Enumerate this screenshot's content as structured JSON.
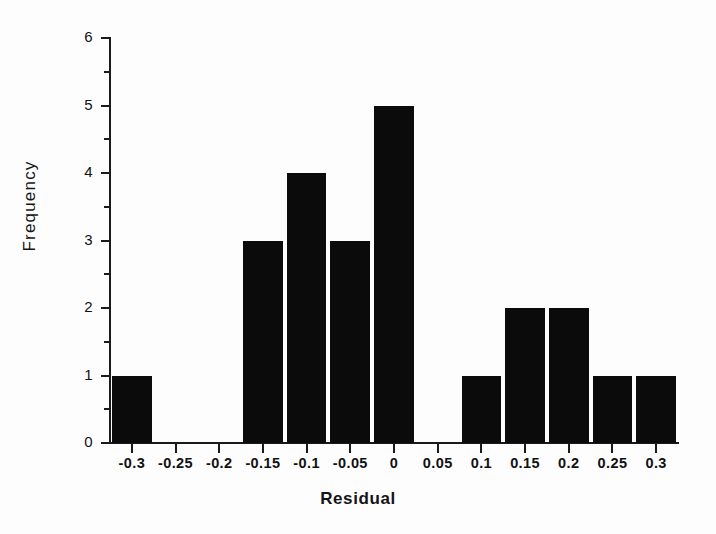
{
  "chart_data": {
    "type": "bar",
    "title": "",
    "xlabel": "Residual",
    "ylabel": "Frequency",
    "categories": [
      "-0.3",
      "-0.25",
      "-0.2",
      "-0.15",
      "-0.1",
      "-0.05",
      "0",
      "0.05",
      "0.1",
      "0.15",
      "0.2",
      "0.25",
      "0.3"
    ],
    "x": [
      -0.3,
      -0.25,
      -0.2,
      -0.15,
      -0.1,
      -0.05,
      0,
      0.05,
      0.1,
      0.15,
      0.2,
      0.25,
      0.3
    ],
    "values": [
      1,
      0,
      0,
      3,
      4,
      3,
      5,
      0,
      1,
      2,
      2,
      1,
      1
    ],
    "xlim": [
      -0.325,
      0.325
    ],
    "ylim": [
      0,
      6
    ],
    "y_major_ticks": [
      0,
      1,
      2,
      3,
      4,
      5,
      6
    ],
    "y_tick_labels": [
      "0",
      "1",
      "2",
      "3",
      "4",
      "5",
      "6"
    ],
    "y_minor_ticks": [
      0.5,
      1.5,
      2.5,
      3.5,
      4.5,
      5.5
    ],
    "x_tick_labels": [
      "-0.3",
      "-0.25",
      "-0.2",
      "-0.15",
      "-0.1",
      "-0.05",
      "0",
      "0.05",
      "0.1",
      "0.15",
      "0.2",
      "0.25",
      "0.3"
    ],
    "grid": false,
    "legend": false,
    "bar_color": "#0b0b0b",
    "axis_color": "#1a1a1a",
    "background_color": "#fdfdfd",
    "bar_alignment": "centered-on-tick",
    "total_count": 23
  },
  "figure": {
    "x_axis_title": "Residual",
    "y_axis_title": "Frequency"
  }
}
